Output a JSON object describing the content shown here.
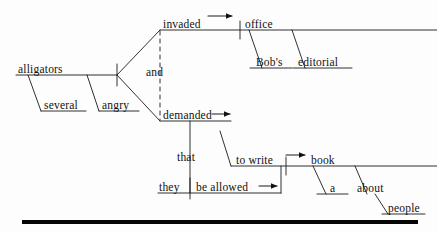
{
  "document": {
    "type": "reed-kellogg-sentence-diagram",
    "title": "Sentence diagram",
    "sentence": "Several angry alligators invaded Bob's editorial office and demanded that they be allowed to write a book about people."
  },
  "colors": {
    "ink": "#111111",
    "line": "#1a1a1a",
    "rule": "#050505",
    "background": "#fdfdfd"
  },
  "words": {
    "subject": "alligators",
    "subject_mod_1": "several",
    "subject_mod_2": "angry",
    "verb_1": "invaded",
    "object_1": "office",
    "object_1_mod_1": "Bob's",
    "object_1_mod_2": "editorial",
    "conjunction": "and",
    "verb_2": "demanded",
    "complementizer": "that",
    "clause_subject": "they",
    "clause_verb": "be allowed",
    "infinitive": "to write",
    "infinitive_object": "book",
    "object_2_mod_1": "a",
    "preposition": "about",
    "prep_object": "people"
  },
  "nodes": [
    {
      "id": "subject",
      "label": "alligators",
      "x": 18,
      "y": 70,
      "name": "word-alligators"
    },
    {
      "id": "subject_mod_1",
      "label": "several",
      "x": 33,
      "y": 106,
      "name": "word-several"
    },
    {
      "id": "subject_mod_2",
      "label": "angry",
      "x": 91,
      "y": 106,
      "name": "word-angry"
    },
    {
      "id": "verb_1",
      "label": "invaded",
      "x": 161,
      "y": 25,
      "name": "word-invaded"
    },
    {
      "id": "object_1",
      "label": "office",
      "x": 243,
      "y": 25,
      "name": "word-office"
    },
    {
      "id": "object_1_mod_1",
      "label": "Bob's",
      "x": 254,
      "y": 63,
      "name": "word-bobs"
    },
    {
      "id": "object_1_mod_2",
      "label": "editorial",
      "x": 297,
      "y": 63,
      "name": "word-editorial"
    },
    {
      "id": "conjunction",
      "label": "and",
      "x": 152,
      "y": 70,
      "name": "word-and"
    },
    {
      "id": "verb_2",
      "label": "demanded",
      "x": 161,
      "y": 117,
      "name": "word-demanded"
    },
    {
      "id": "complementizer",
      "label": "that",
      "x": 178,
      "y": 158,
      "name": "word-that"
    },
    {
      "id": "clause_subject",
      "label": "they",
      "x": 160,
      "y": 188,
      "name": "word-they"
    },
    {
      "id": "clause_verb",
      "label": "be allowed",
      "x": 194,
      "y": 188,
      "name": "word-be-allowed"
    },
    {
      "id": "infinitive",
      "label": "to write",
      "x": 233,
      "y": 161,
      "name": "word-to-write"
    },
    {
      "id": "infinitive_object",
      "label": "book",
      "x": 309,
      "y": 161,
      "name": "word-book"
    },
    {
      "id": "object_2_mod_1",
      "label": "a",
      "x": 327,
      "y": 188,
      "name": "word-a"
    },
    {
      "id": "preposition",
      "label": "about",
      "x": 359,
      "y": 188,
      "name": "word-about"
    },
    {
      "id": "prep_object",
      "label": "people",
      "x": 384,
      "y": 209,
      "name": "word-people"
    }
  ],
  "rule": {
    "name": "bottom-rule",
    "x1": 22,
    "x2": 418,
    "y": 222,
    "thickness": 4
  }
}
